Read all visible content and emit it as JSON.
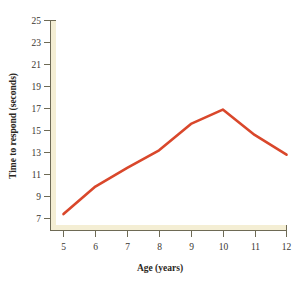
{
  "chart_data": {
    "type": "line",
    "title": "",
    "xlabel": "Age (years)",
    "ylabel": "Time to respond (seconds)",
    "x": [
      5,
      6,
      7,
      8,
      9,
      10,
      11,
      12
    ],
    "values": [
      7.4,
      9.9,
      11.6,
      13.2,
      15.6,
      16.9,
      14.6,
      12.8
    ],
    "series": [
      {
        "name": "Time to respond",
        "values": [
          7.4,
          9.9,
          11.6,
          13.2,
          15.6,
          16.9,
          14.6,
          12.8
        ],
        "color": "#d9472b"
      }
    ],
    "xlim": [
      4.6,
      12.2
    ],
    "ylim": [
      5.6,
      25.4
    ],
    "xticks": [
      5,
      6,
      7,
      8,
      9,
      10,
      11,
      12
    ],
    "yticks": [
      7,
      9,
      11,
      13,
      15,
      17,
      19,
      21,
      23,
      25
    ],
    "xtick_labels": [
      "5",
      "6",
      "7",
      "8",
      "9",
      "10",
      "11",
      "12"
    ],
    "ytick_labels": [
      "7",
      "9",
      "11",
      "13",
      "15",
      "17",
      "19",
      "21",
      "23",
      "25"
    ],
    "grid": false,
    "legend": "none",
    "markers": false,
    "line_color": "#d9472b",
    "axis_band_color": "#f4eed4",
    "axis_line_color": "#8d8668",
    "background_color": "#ffffff"
  },
  "axis": {
    "x_title": "Age (years)",
    "y_title": "Time to respond (seconds)"
  },
  "ticks": {
    "y": [
      "25",
      "23",
      "21",
      "19",
      "17",
      "15",
      "13",
      "11",
      "9",
      "7"
    ],
    "x": [
      "5",
      "6",
      "7",
      "8",
      "9",
      "10",
      "11",
      "12"
    ]
  }
}
